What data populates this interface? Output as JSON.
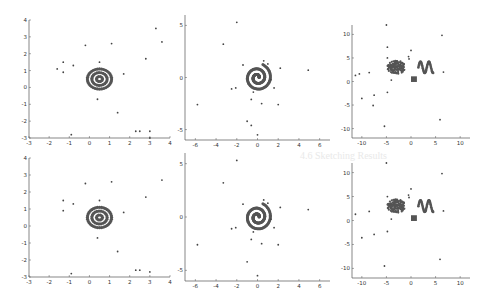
{
  "chart_data": [
    {
      "id": "top-left",
      "type": "scatter",
      "xlim": [
        -3,
        4
      ],
      "ylim": [
        -3,
        4
      ],
      "xticks": [
        -3,
        -2,
        -1,
        0,
        1,
        2,
        3,
        4
      ],
      "yticks": [
        -3,
        -2,
        -1,
        0,
        1,
        2,
        3,
        4
      ],
      "pattern": {
        "kind": "concentric-rings",
        "center": [
          0.5,
          0.5
        ],
        "radii": [
          0.15,
          0.38,
          0.6
        ]
      },
      "outliers": [
        [
          3.3,
          3.5
        ],
        [
          3.6,
          2.7
        ],
        [
          1.1,
          2.6
        ],
        [
          -0.2,
          2.5
        ],
        [
          2.8,
          1.7
        ],
        [
          0.5,
          1.5
        ],
        [
          -1.3,
          1.5
        ],
        [
          -0.8,
          1.3
        ],
        [
          -1.6,
          1.1
        ],
        [
          -1.3,
          0.9
        ],
        [
          1.7,
          0.8
        ],
        [
          0.4,
          -0.7
        ],
        [
          1.4,
          -1.5
        ],
        [
          2.3,
          -2.6
        ],
        [
          2.5,
          -2.6
        ],
        [
          3.0,
          -2.6
        ],
        [
          -0.9,
          -2.8
        ],
        [
          3.0,
          -3.0
        ]
      ]
    },
    {
      "id": "top-middle",
      "type": "scatter",
      "xlim": [
        -7,
        7
      ],
      "ylim": [
        -6,
        6
      ],
      "xticks": [
        -6,
        -4,
        -2,
        0,
        2,
        4,
        6
      ],
      "yticks": [
        -5,
        0,
        5
      ],
      "pattern": {
        "kind": "spiral",
        "center": [
          0,
          0
        ],
        "turns": 2.2,
        "max_radius": 1.2
      },
      "outliers": [
        [
          -2,
          5.3
        ],
        [
          -3.3,
          3.2
        ],
        [
          -1.4,
          1.2
        ],
        [
          0.6,
          1.6
        ],
        [
          1.0,
          1.3
        ],
        [
          2.2,
          0.9
        ],
        [
          4.9,
          0.7
        ],
        [
          1.3,
          -0.2
        ],
        [
          1.6,
          -1.0
        ],
        [
          -2.5,
          -1.1
        ],
        [
          -2.1,
          -1.0
        ],
        [
          -0.4,
          -1.4
        ],
        [
          -0.6,
          -2.1
        ],
        [
          0.4,
          -2.5
        ],
        [
          2.0,
          -2.6
        ],
        [
          -5.8,
          -2.6
        ],
        [
          -1.0,
          -4.2
        ],
        [
          -0.6,
          -4.6
        ],
        [
          0,
          -5.5
        ]
      ]
    },
    {
      "id": "top-right",
      "type": "scatter",
      "xlim": [
        -12,
        12
      ],
      "ylim": [
        -12,
        12
      ],
      "xticks": [
        -10,
        -5,
        0,
        5,
        10
      ],
      "yticks": [
        -10,
        -5,
        0,
        5,
        10
      ],
      "pattern": [
        {
          "kind": "blob",
          "center": [
            -3,
            3
          ],
          "radius": 1.8
        },
        {
          "kind": "sine-wave",
          "x_range": [
            1.5,
            4.5
          ],
          "y_center": 3,
          "amplitude": 1.2
        },
        {
          "kind": "square",
          "center": [
            0.6,
            0.5
          ],
          "size": 1.2
        }
      ],
      "outliers": [
        [
          -5,
          12
        ],
        [
          6.3,
          9.8
        ],
        [
          -4.8,
          7.3
        ],
        [
          0,
          6.6
        ],
        [
          -0.5,
          5.3
        ],
        [
          -0.4,
          4.8
        ],
        [
          -4.8,
          5
        ],
        [
          -10.5,
          1.6
        ],
        [
          -11.3,
          1.3
        ],
        [
          -8.5,
          1.9
        ],
        [
          6.6,
          2.0
        ],
        [
          -4,
          0.3
        ],
        [
          -4.8,
          -2.3
        ],
        [
          -7.5,
          -2.9
        ],
        [
          -10,
          -3.6
        ],
        [
          -7.7,
          -5.1
        ],
        [
          5.9,
          -8.1
        ],
        [
          -5.4,
          -9.5
        ]
      ]
    },
    {
      "id": "bottom-left",
      "type": "scatter",
      "xlim": [
        -3,
        4
      ],
      "ylim": [
        -3,
        4
      ],
      "xticks": [
        -3,
        -2,
        -1,
        0,
        1,
        2,
        3,
        4
      ],
      "yticks": [
        -3,
        -2,
        -1,
        0,
        1,
        2,
        3,
        4
      ],
      "pattern": {
        "kind": "concentric-rings",
        "center": [
          0.5,
          0.5
        ],
        "radii": [
          0.15,
          0.38,
          0.6
        ]
      },
      "outliers": [
        [
          3.6,
          2.7
        ],
        [
          1.1,
          2.6
        ],
        [
          -0.2,
          2.5
        ],
        [
          2.8,
          1.7
        ],
        [
          0.5,
          1.5
        ],
        [
          -1.3,
          1.5
        ],
        [
          -0.8,
          1.3
        ],
        [
          -1.3,
          0.9
        ],
        [
          1.7,
          0.8
        ],
        [
          0.4,
          -0.7
        ],
        [
          1.4,
          -1.5
        ],
        [
          2.3,
          -2.6
        ],
        [
          2.5,
          -2.6
        ],
        [
          3.0,
          -2.7
        ],
        [
          -0.9,
          -2.8
        ]
      ]
    },
    {
      "id": "bottom-middle",
      "type": "scatter",
      "xlim": [
        -7,
        7
      ],
      "ylim": [
        -6,
        6
      ],
      "xticks": [
        -6,
        -4,
        -2,
        0,
        2,
        4,
        6
      ],
      "yticks": [
        -5,
        0,
        5
      ],
      "pattern": {
        "kind": "spiral",
        "center": [
          0,
          0
        ],
        "turns": 2.2,
        "max_radius": 1.2
      },
      "outliers": [
        [
          -2,
          5.3
        ],
        [
          -3.3,
          3.2
        ],
        [
          -1.4,
          1.2
        ],
        [
          0.6,
          1.6
        ],
        [
          1.0,
          1.3
        ],
        [
          2.2,
          0.9
        ],
        [
          4.9,
          0.7
        ],
        [
          1.3,
          -0.2
        ],
        [
          1.6,
          -1.0
        ],
        [
          -2.5,
          -1.1
        ],
        [
          -2.1,
          -1.0
        ],
        [
          -0.4,
          -1.4
        ],
        [
          -0.6,
          -2.1
        ],
        [
          0.4,
          -2.5
        ],
        [
          2.0,
          -2.6
        ],
        [
          -5.8,
          -2.6
        ],
        [
          -1.0,
          -4.2
        ],
        [
          0,
          -5.5
        ]
      ]
    },
    {
      "id": "bottom-right",
      "type": "scatter",
      "xlim": [
        -12,
        12
      ],
      "ylim": [
        -12,
        12
      ],
      "xticks": [
        -10,
        -5,
        0,
        5,
        10
      ],
      "yticks": [
        -10,
        -5,
        0,
        5,
        10
      ],
      "pattern": [
        {
          "kind": "blob",
          "center": [
            -3,
            3
          ],
          "radius": 1.8
        },
        {
          "kind": "sine-wave",
          "x_range": [
            1.5,
            4.5
          ],
          "y_center": 3,
          "amplitude": 1.2
        },
        {
          "kind": "square",
          "center": [
            0.6,
            0.5
          ],
          "size": 1.2
        }
      ],
      "outliers": [
        [
          -5,
          12
        ],
        [
          6.3,
          9.8
        ],
        [
          0,
          6.6
        ],
        [
          -0.5,
          5.3
        ],
        [
          -0.4,
          4.8
        ],
        [
          -4.8,
          5
        ],
        [
          -11.3,
          1.3
        ],
        [
          -8.5,
          1.9
        ],
        [
          6.6,
          2.0
        ],
        [
          -4,
          0.3
        ],
        [
          -4.8,
          -2.3
        ],
        [
          -7.5,
          -2.9
        ],
        [
          -10,
          -3.6
        ],
        [
          5.9,
          -8.1
        ],
        [
          -5.4,
          -9.5
        ]
      ]
    }
  ],
  "layout": [
    {
      "x0": 29,
      "x1": 170,
      "y0": 20,
      "y1": 138
    },
    {
      "x0": 185,
      "x1": 330,
      "y0": 15,
      "y1": 140
    },
    {
      "x0": 352,
      "x1": 470,
      "y0": 25,
      "y1": 138
    },
    {
      "x0": 29,
      "x1": 170,
      "y0": 158,
      "y1": 277
    },
    {
      "x0": 185,
      "x1": 330,
      "y0": 153,
      "y1": 281
    },
    {
      "x0": 352,
      "x1": 470,
      "y0": 163,
      "y1": 278
    }
  ],
  "colors": {
    "axis": "#555555",
    "points": "#444444",
    "pattern": "#555555"
  },
  "background_ghost_text": [
    "4.6  Sketching Results"
  ]
}
